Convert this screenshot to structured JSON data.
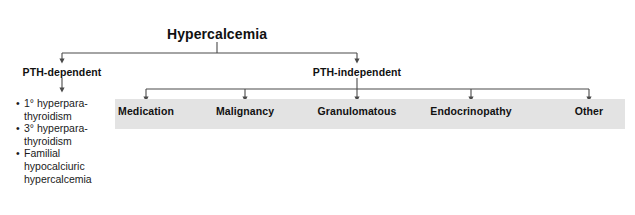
{
  "diagram": {
    "root": {
      "label": "Hypercalcemia",
      "x": 217,
      "y": 26
    },
    "branches": [
      {
        "label": "PTH-dependent",
        "x": 62,
        "y": 66
      },
      {
        "label": "PTH-independent",
        "x": 357,
        "y": 66
      }
    ],
    "pth_dependent_causes": [
      "1° hyperpara-\nthyroidism",
      "3° hyperpara-\nthyroidism",
      "Familial\nhypocalciuric\nhypercalcemia"
    ],
    "pth_dependent_causes_lines": [
      [
        "1° hyperpara-",
        "thyroidism"
      ],
      [
        "3° hyperpara-",
        "thyroidism"
      ],
      [
        "Familial",
        "hypocalciuric",
        "hypercalcemia"
      ]
    ],
    "pth_independent_categories": [
      {
        "label": "Medication",
        "x": 146
      },
      {
        "label": "Malignancy",
        "x": 245
      },
      {
        "label": "Granulomatous",
        "x": 357
      },
      {
        "label": "Endocrinopathy",
        "x": 471
      },
      {
        "label": "Other",
        "x": 589
      }
    ],
    "colors": {
      "background": "#ffffff",
      "band_fill": "#e3e3e3",
      "connector": "#4a4a4a",
      "text": "#111111"
    }
  }
}
